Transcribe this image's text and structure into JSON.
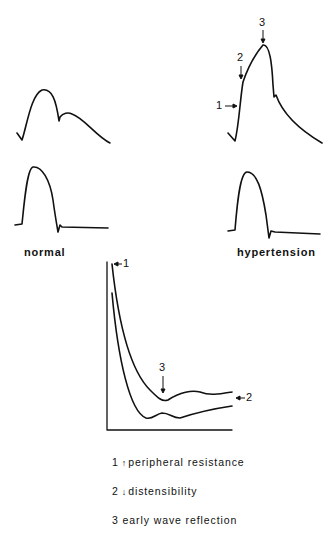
{
  "panels": {
    "normal": {
      "label": "normal"
    },
    "hypertension": {
      "label": "hypertension"
    }
  },
  "markers": {
    "hyp_top": [
      "1",
      "2",
      "3"
    ],
    "impedance": [
      "1",
      "2",
      "3"
    ]
  },
  "legend": {
    "items": [
      {
        "num": "1",
        "arrow": "↑",
        "text": "peripheral resistance"
      },
      {
        "num": "2",
        "arrow": "↓",
        "text": "distensibility"
      },
      {
        "num": "3",
        "arrow": "",
        "text": "early wave reflection"
      }
    ]
  },
  "colors": {
    "line": "#111111",
    "background": "#ffffff"
  }
}
